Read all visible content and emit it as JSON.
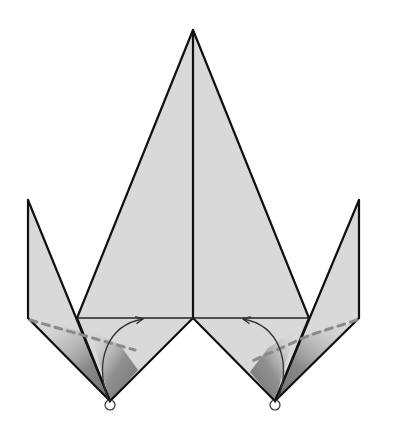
{
  "diagram": {
    "type": "origami-fold-step",
    "colors": {
      "paper": "#d9d9d9",
      "edge": "#111111",
      "valley_fold": "#8a8a8a",
      "shade_dark": "#6e6e6e",
      "background": "#ffffff"
    },
    "points": {
      "apex": [
        193,
        30
      ],
      "center_notch": [
        193,
        318
      ],
      "left_inner_shoulder": [
        77,
        318
      ],
      "right_inner_shoulder": [
        309,
        318
      ],
      "left_flap_top": [
        28,
        200
      ],
      "left_flap_corner": [
        28,
        318
      ],
      "right_flap_top": [
        359,
        200
      ],
      "right_flap_corner": [
        359,
        318
      ],
      "left_bottom_point": [
        110,
        401
      ],
      "right_bottom_point": [
        275,
        401
      ]
    },
    "annotations": [
      {
        "name": "left-valley-fold-line",
        "kind": "valley-fold"
      },
      {
        "name": "right-valley-fold-line",
        "kind": "valley-fold"
      },
      {
        "name": "left-fold-arrow",
        "kind": "fold-arrow",
        "direction": "up-right"
      },
      {
        "name": "right-fold-arrow",
        "kind": "fold-arrow",
        "direction": "up-left"
      },
      {
        "name": "left-pivot-circle",
        "kind": "reference-point"
      },
      {
        "name": "right-pivot-circle",
        "kind": "reference-point"
      }
    ]
  }
}
